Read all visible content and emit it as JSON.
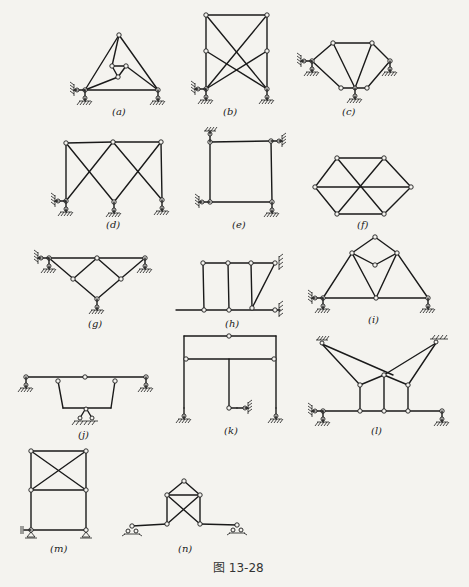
{
  "figure": {
    "caption": "图 13-28",
    "labels": {
      "a": "(a)",
      "b": "(b)",
      "c": "(c)",
      "d": "(d)",
      "e": "(e)",
      "f": "(f)",
      "g": "(g)",
      "h": "(h)",
      "i": "(i)",
      "j": "(j)",
      "k": "(k)",
      "l": "(l)",
      "m": "(m)",
      "n": "(n)"
    },
    "panels": [
      {
        "id": "a",
        "type": "triangular truss with inner triangle, pin + roller supports"
      },
      {
        "id": "b",
        "type": "rectangular frame with crossed diagonals and mid-height joints"
      },
      {
        "id": "c",
        "type": "hexagonal truss with three ground supports"
      },
      {
        "id": "d",
        "type": "double-bay X-braced frame with three supports"
      },
      {
        "id": "e",
        "type": "rectangular frame with two wall links and one roller"
      },
      {
        "id": "f",
        "type": "hexagon with three full diagonals"
      },
      {
        "id": "g",
        "type": "inverted triangular truss with diamond, four supports"
      },
      {
        "id": "h",
        "type": "three-post frame on ground beam with inclined link to wall"
      },
      {
        "id": "i",
        "type": "triangular truss with top diamond"
      },
      {
        "id": "j",
        "type": "beam with trapezoidal suspended frame"
      },
      {
        "id": "k",
        "type": "portal frame with inner hanging post"
      },
      {
        "id": "l",
        "type": "beam suspended from two wall supports via links"
      },
      {
        "id": "m",
        "type": "two-storey frame with X-brace in upper panel"
      },
      {
        "id": "n",
        "type": "X-braced square with triangular cap on roller supports"
      }
    ]
  }
}
